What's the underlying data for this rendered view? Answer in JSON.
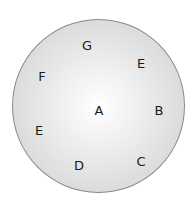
{
  "diagram": {
    "shape": "circle",
    "colors": {
      "edge": "#8a8a8a",
      "center": "#ffffff",
      "rim": "#c6c6c6",
      "text": "#1a1a1a"
    },
    "labels": [
      {
        "text": "G",
        "x": 87,
        "y": 45
      },
      {
        "text": "E",
        "x": 141,
        "y": 63
      },
      {
        "text": "F",
        "x": 42,
        "y": 76
      },
      {
        "text": "A",
        "x": 99,
        "y": 110
      },
      {
        "text": "B",
        "x": 159,
        "y": 110
      },
      {
        "text": "E",
        "x": 39,
        "y": 130
      },
      {
        "text": "D",
        "x": 79,
        "y": 165
      },
      {
        "text": "C",
        "x": 141,
        "y": 161
      }
    ]
  }
}
